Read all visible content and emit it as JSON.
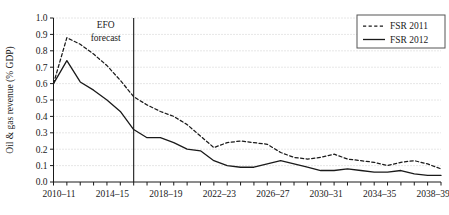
{
  "chart_data": {
    "type": "line",
    "title": "",
    "xlabel": "",
    "ylabel": "Oil & gas revenue (% GDP)",
    "ylim": [
      0.0,
      1.0
    ],
    "ytick_labels": [
      "0.0",
      "0.1",
      "0.2",
      "0.3",
      "0.4",
      "0.5",
      "0.6",
      "0.7",
      "0.8",
      "0.9",
      "1.0"
    ],
    "ytick_values": [
      0.0,
      0.1,
      0.2,
      0.3,
      0.4,
      0.5,
      0.6,
      0.7,
      0.8,
      0.9,
      1.0
    ],
    "grid": true,
    "grid_style": "dotted-horizontal",
    "legend_position": "top-right",
    "categories": [
      "2010-11",
      "2011-12",
      "2012-13",
      "2013-14",
      "2014-15",
      "2015-16",
      "2016-17",
      "2017-18",
      "2018-19",
      "2019-20",
      "2020-21",
      "2021-22",
      "2022-23",
      "2023-24",
      "2024-25",
      "2025-26",
      "2026-27",
      "2027-28",
      "2028-29",
      "2029-30",
      "2030-31",
      "2031-32",
      "2032-33",
      "2033-34",
      "2034-35",
      "2035-36",
      "2036-37",
      "2037-38",
      "2038-39",
      "2039-40"
    ],
    "xtick_labels": [
      "2010-11",
      "2014-15",
      "2018-19",
      "2022-23",
      "2026-27",
      "2030-31",
      "2034-35",
      "2038-39"
    ],
    "xtick_label_indices": [
      0,
      4,
      8,
      12,
      16,
      20,
      24,
      28
    ],
    "series": [
      {
        "name": "FSR 2011",
        "style": "dashed",
        "color": "#1a1a1a",
        "values": [
          0.6,
          0.88,
          0.84,
          0.78,
          0.71,
          0.62,
          0.52,
          0.47,
          0.43,
          0.4,
          0.35,
          0.28,
          0.21,
          0.24,
          0.25,
          0.24,
          0.23,
          0.18,
          0.15,
          0.14,
          0.15,
          0.17,
          0.14,
          0.13,
          0.12,
          0.1,
          0.12,
          0.13,
          0.11,
          0.08
        ]
      },
      {
        "name": "FSR 2012",
        "style": "solid",
        "color": "#1a1a1a",
        "values": [
          0.6,
          0.74,
          0.61,
          0.56,
          0.5,
          0.43,
          0.32,
          0.27,
          0.27,
          0.24,
          0.2,
          0.19,
          0.13,
          0.1,
          0.09,
          0.09,
          0.11,
          0.13,
          0.11,
          0.09,
          0.07,
          0.07,
          0.08,
          0.07,
          0.06,
          0.06,
          0.07,
          0.05,
          0.04,
          0.04
        ]
      }
    ],
    "annotations": [
      {
        "name": "efo-forecast",
        "text_line1": "EFO",
        "text_line2": "forecast",
        "marker": "vertical-line",
        "at_category": "2016-17"
      }
    ]
  },
  "legend": {
    "items": [
      {
        "label": "FSR 2011",
        "style": "dashed"
      },
      {
        "label": "FSR 2012",
        "style": "solid"
      }
    ]
  }
}
